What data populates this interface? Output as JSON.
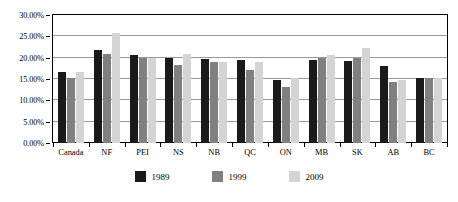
{
  "chart_data": {
    "type": "bar",
    "title": "",
    "subtitle": "",
    "xlabel": "",
    "ylabel": "",
    "ylim": [
      0,
      30
    ],
    "ytick_labels": [
      "0.00%",
      "5.00%",
      "10.00%",
      "15.00%",
      "20.00%",
      "25.00%",
      "30.00%"
    ],
    "ytick_values": [
      0,
      5,
      10,
      15,
      20,
      25,
      30
    ],
    "grid": true,
    "legend_position": "bottom",
    "categories": [
      "Canada",
      "NF",
      "PEI",
      "NS",
      "NB",
      "QC",
      "ON",
      "MB",
      "SK",
      "AB",
      "BC"
    ],
    "series": [
      {
        "name": "1989",
        "color": "#1a1a1a",
        "values": [
          16.7,
          21.8,
          20.7,
          20.0,
          19.8,
          19.5,
          14.8,
          19.5,
          19.3,
          18.0,
          15.2
        ]
      },
      {
        "name": "1999",
        "color": "#808080",
        "values": [
          15.2,
          20.8,
          19.9,
          18.4,
          18.9,
          17.2,
          13.2,
          19.9,
          20.0,
          14.3,
          15.2
        ]
      },
      {
        "name": "2009",
        "color": "#d4d4d4",
        "values": [
          16.7,
          25.7,
          20.0,
          20.8,
          18.9,
          18.9,
          15.2,
          20.6,
          22.3,
          14.8,
          15.2
        ]
      }
    ]
  },
  "legend": {
    "entries": [
      {
        "label": "1989",
        "color": "#1a1a1a"
      },
      {
        "label": "1999",
        "color": "#808080"
      },
      {
        "label": "2009",
        "color": "#d4d4d4"
      }
    ]
  }
}
